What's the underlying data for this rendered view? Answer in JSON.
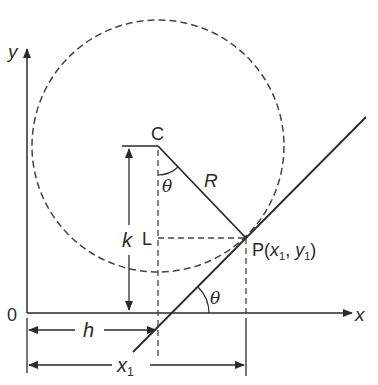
{
  "diagram": {
    "labels": {
      "y_axis": "y",
      "x_axis": "x",
      "origin": "0",
      "center": "C",
      "radius": "R",
      "foot": "L",
      "k": "k",
      "h": "h",
      "x1": "x",
      "x1_sub": "1",
      "theta_center": "θ",
      "theta_axis": "θ",
      "point_P_prefix": "P(",
      "point_P_x": "x",
      "point_P_x_sub": "1",
      "point_P_sep": ", ",
      "point_P_y": "y",
      "point_P_y_sub": "1",
      "point_P_suffix": ")"
    },
    "colors": {
      "stroke": "#2a2a2a",
      "dashed": "#444444",
      "background": "#ffffff"
    }
  }
}
